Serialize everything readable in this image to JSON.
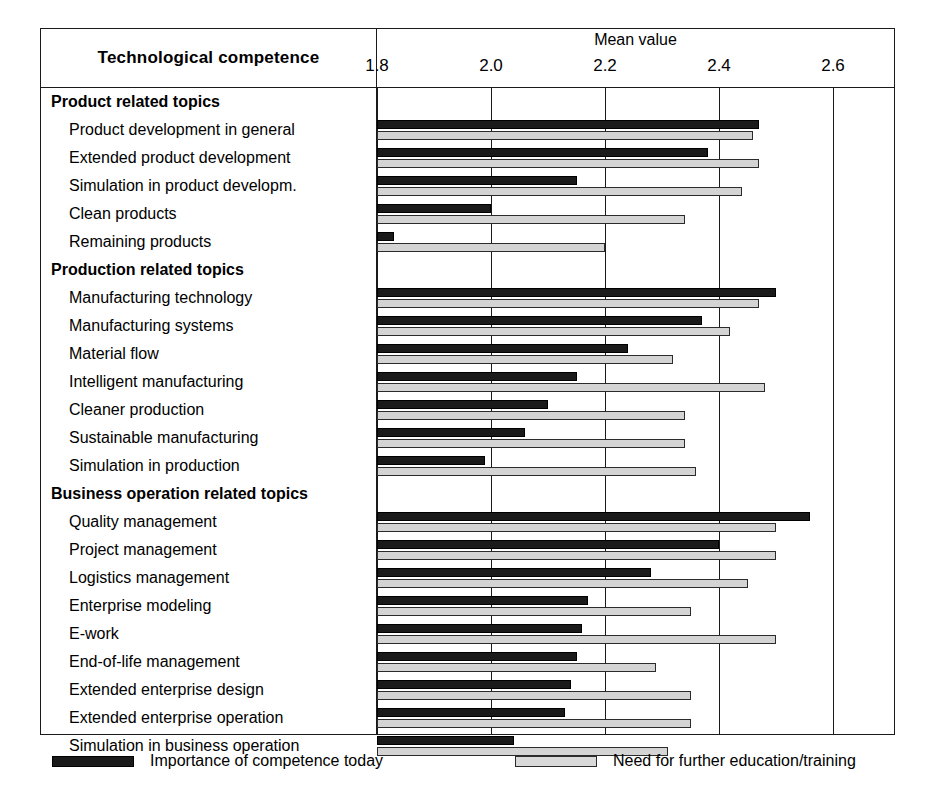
{
  "header": {
    "row_header_label": "Technological competence",
    "axis_title": "Mean value"
  },
  "legend": {
    "items": [
      {
        "swatch": "dark-swatch",
        "label": "Importance of competence today"
      },
      {
        "swatch": "light-swatch",
        "label": "Need for further education/training"
      }
    ]
  },
  "chart_data": {
    "type": "bar",
    "orientation": "horizontal",
    "title": "Technological competence",
    "xlabel": "Mean value",
    "ylabel": "Technological competence",
    "xlim": [
      1.75,
      2.68
    ],
    "grid": true,
    "legend_position": "bottom",
    "ticks": [
      "1.8",
      "2.0",
      "2.2",
      "2.4",
      "2.6"
    ],
    "tick_values": [
      1.8,
      2.0,
      2.2,
      2.4,
      2.6
    ],
    "series": [
      {
        "name": "Importance of competence today",
        "color": "#1a1a1a"
      },
      {
        "name": "Need for further education/training",
        "color": "#d4d4d4"
      }
    ],
    "groups": [
      {
        "label": "Product related topics",
        "rows": [
          {
            "label": "Product development in general",
            "importance": 2.47,
            "need": 2.46
          },
          {
            "label": "Extended product development",
            "importance": 2.38,
            "need": 2.47
          },
          {
            "label": "Simulation in product developm.",
            "importance": 2.15,
            "need": 2.44
          },
          {
            "label": "Clean products",
            "importance": 2.0,
            "need": 2.34
          },
          {
            "label": "Remaining products",
            "importance": 1.83,
            "need": 2.2
          }
        ]
      },
      {
        "label": "Production related topics",
        "rows": [
          {
            "label": "Manufacturing technology",
            "importance": 2.5,
            "need": 2.47
          },
          {
            "label": "Manufacturing systems",
            "importance": 2.37,
            "need": 2.42
          },
          {
            "label": "Material flow",
            "importance": 2.24,
            "need": 2.32
          },
          {
            "label": "Intelligent manufacturing",
            "importance": 2.15,
            "need": 2.48
          },
          {
            "label": "Cleaner production",
            "importance": 2.1,
            "need": 2.34
          },
          {
            "label": "Sustainable manufacturing",
            "importance": 2.06,
            "need": 2.34
          },
          {
            "label": "Simulation in production",
            "importance": 1.99,
            "need": 2.36
          }
        ]
      },
      {
        "label": "Business operation related topics",
        "rows": [
          {
            "label": "Quality management",
            "importance": 2.56,
            "none": 0,
            "need": 2.5
          },
          {
            "label": "Project management",
            "importance": 2.4,
            "need": 2.5
          },
          {
            "label": "Logistics management",
            "importance": 2.28,
            "need": 2.45
          },
          {
            "label": "Enterprise modeling",
            "importance": 2.17,
            "need": 2.35
          },
          {
            "label": "E-work",
            "importance": 2.16,
            "need": 2.5
          },
          {
            "label": "End-of-life management",
            "importance": 2.15,
            "need": 2.29
          },
          {
            "label": "Extended enterprise design",
            "importance": 2.14,
            "need": 2.35
          },
          {
            "label": "Extended enterprise operation",
            "importance": 2.13,
            "need": 2.35
          },
          {
            "label": "Simulation in business operation",
            "importance": 2.04,
            "need": 2.31
          }
        ]
      }
    ]
  }
}
